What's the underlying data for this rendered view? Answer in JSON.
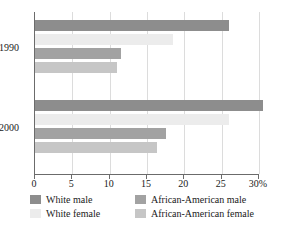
{
  "chart_data": {
    "type": "bar",
    "orientation": "horizontal",
    "title": "",
    "xlabel": "",
    "ylabel": "",
    "xlim": [
      0,
      30
    ],
    "xticks": [
      "0",
      "5",
      "10",
      "15",
      "20",
      "25",
      "30%"
    ],
    "xtick_values": [
      0,
      5,
      10,
      15,
      20,
      25,
      30
    ],
    "grid": true,
    "categories": [
      "1990",
      "2000"
    ],
    "legend_position": "bottom",
    "series": [
      {
        "name": "White male",
        "color": "#8d8d8d",
        "values": [
          26.0,
          30.5
        ]
      },
      {
        "name": "White female",
        "color": "#ececec",
        "values": [
          18.5,
          26.0
        ]
      },
      {
        "name": "African-American male",
        "color": "#a2a2a2",
        "values": [
          11.5,
          17.5
        ]
      },
      {
        "name": "African-American female",
        "color": "#c6c6c6",
        "values": [
          11.0,
          16.3
        ]
      }
    ]
  },
  "axis": {
    "x_max_label": "30%",
    "group_labels": [
      "1990",
      "2000"
    ]
  },
  "legend": {
    "entries": [
      {
        "label": "White male",
        "color": "#8d8d8d"
      },
      {
        "label": "African-American male",
        "color": "#a2a2a2"
      },
      {
        "label": "White female",
        "color": "#ececec"
      },
      {
        "label": "African-American female",
        "color": "#c6c6c6"
      }
    ]
  }
}
